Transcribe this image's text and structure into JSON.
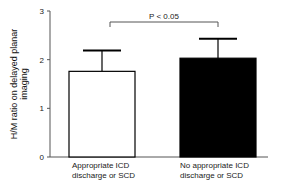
{
  "chart_data": {
    "type": "bar",
    "title": "",
    "xlabel": "",
    "ylabel": "H/M ratio on delayed planar imaging",
    "ylabel_lines": [
      "H/M ratio on delayed planar",
      "imaging"
    ],
    "ylim": [
      0,
      3
    ],
    "yticks": [
      0,
      1,
      2,
      3
    ],
    "grid": false,
    "legend": null,
    "categories": [
      "Appropriate ICD discharge or SCD",
      "No appropriate ICD discharge or SCD"
    ],
    "category_lines": [
      [
        "Appropriate ICD",
        "discharge or SCD"
      ],
      [
        "No appropriate ICD",
        "discharge or SCD"
      ]
    ],
    "values": [
      1.76,
      2.03
    ],
    "error_upper": [
      2.19,
      2.43
    ],
    "bar_colors": [
      "#ffffff",
      "#000000"
    ],
    "annotations": [
      {
        "type": "significance_bracket",
        "between": [
          0,
          1
        ],
        "text": "P < 0.05"
      }
    ]
  }
}
